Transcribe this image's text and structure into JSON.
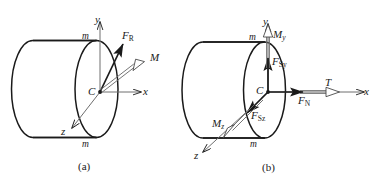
{
  "figure": {
    "background": "#ffffff",
    "stroke_color": "#1a1a1a",
    "width": 379,
    "height": 187
  },
  "panels": [
    {
      "id": "a",
      "caption": "(a)",
      "description": "Resultant internal force and moment at the centroid of the cut section",
      "axes": [
        {
          "name": "y-axis",
          "label": "y",
          "direction": "up"
        },
        {
          "name": "x-axis",
          "label": "x",
          "direction": "right"
        },
        {
          "name": "z-axis",
          "label": "z",
          "direction": "lower-left"
        }
      ],
      "points": [
        {
          "name": "centroid",
          "label": "C"
        }
      ],
      "section_marks": [
        {
          "name": "section-mark-top",
          "label": "m"
        },
        {
          "name": "section-mark-bottom",
          "label": "m"
        }
      ],
      "vectors": [
        {
          "name": "resultant-force",
          "label_main": "F",
          "label_sub": "R",
          "sub_style": "upright",
          "style": "solid-arrow",
          "direction": "up-right"
        },
        {
          "name": "resultant-moment",
          "label_main": "M",
          "label_sub": "",
          "sub_style": "none",
          "style": "double-line-arrow",
          "direction": "up-right"
        }
      ]
    },
    {
      "id": "b",
      "caption": "(b)",
      "description": "Components of the internal force and moment resultants",
      "axes": [
        {
          "name": "y-axis",
          "label": "y",
          "direction": "up"
        },
        {
          "name": "x-axis",
          "label": "x",
          "direction": "right"
        },
        {
          "name": "z-axis",
          "label": "z",
          "direction": "lower-left"
        }
      ],
      "points": [
        {
          "name": "centroid",
          "label": "C"
        }
      ],
      "section_marks": [
        {
          "name": "section-mark-top",
          "label": "m"
        },
        {
          "name": "section-mark-bottom",
          "label": "m"
        }
      ],
      "vectors": [
        {
          "name": "normal-force",
          "label_main": "F",
          "label_sub": "N",
          "sub_style": "upright",
          "style": "solid-arrow",
          "direction": "right"
        },
        {
          "name": "shear-force-y",
          "label_main": "F",
          "label_sub": "Sy",
          "sub_style": "mixed",
          "style": "solid-arrow",
          "direction": "up"
        },
        {
          "name": "shear-force-z",
          "label_main": "F",
          "label_sub": "Sz",
          "sub_style": "mixed",
          "style": "solid-arrow",
          "direction": "lower-left"
        },
        {
          "name": "torque",
          "label_main": "T",
          "label_sub": "",
          "sub_style": "none",
          "style": "double-line-arrow",
          "direction": "right"
        },
        {
          "name": "bending-moment-y",
          "label_main": "M",
          "label_sub": "y",
          "sub_style": "italic",
          "style": "double-line-arrow",
          "direction": "up"
        },
        {
          "name": "bending-moment-z",
          "label_main": "M",
          "label_sub": "z",
          "sub_style": "italic",
          "style": "double-line-arrow",
          "direction": "lower-left"
        }
      ]
    }
  ]
}
